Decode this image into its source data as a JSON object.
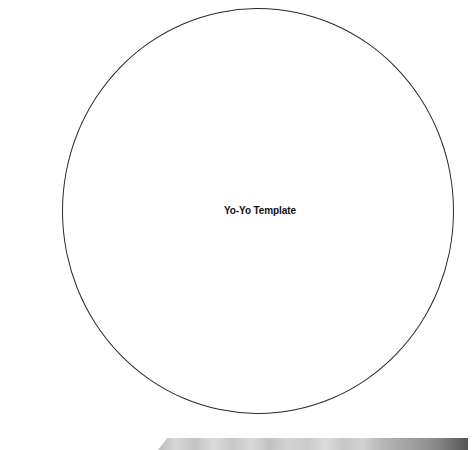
{
  "template": {
    "title": "Yo-Yo Template",
    "shape": "circle",
    "outline_color": "#2a2a2a"
  },
  "scan_artifact": {
    "description": "gray scanner edge strip at bottom",
    "color": "#c8c8c8"
  }
}
